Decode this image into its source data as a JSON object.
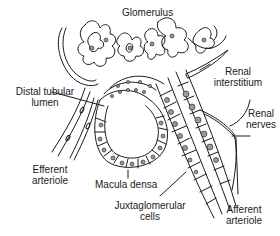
{
  "figure": {
    "labels": {
      "glomerulus": "Glomerulus",
      "distal_tubular_lumen_1": "Distal tubular",
      "distal_tubular_lumen_2": "lumen",
      "renal_interstitium_1": "Renal",
      "renal_interstitium_2": "interstitium",
      "renal_nerves_1": "Renal",
      "renal_nerves_2": "nerves",
      "efferent_arteriole_1": "Efferent",
      "efferent_arteriole_2": "arteriole",
      "macula_densa": "Macula densa",
      "juxtaglomerular_cells_1": "Juxtaglomerular",
      "juxtaglomerular_cells_2": "cells",
      "afferent_arteriole_1": "Afferent",
      "afferent_arteriole_2": "arteriole"
    },
    "colors": {
      "line": "#1a1a1a",
      "cell_fill": "#e6e6e6",
      "nucleus": "#9a9a9a",
      "background": "#ffffff"
    }
  }
}
